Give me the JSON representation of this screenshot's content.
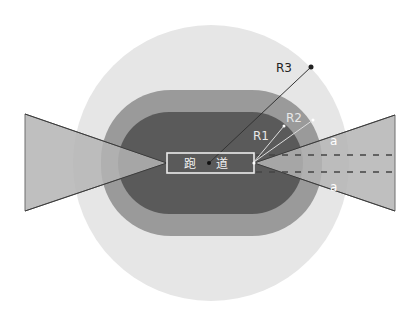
{
  "diagram": {
    "colors": {
      "background": "#ffffff",
      "outer_circle": "#e6e6e6",
      "middle_zone": "#9a9a9a",
      "inner_zone": "#5a5a5a",
      "triangle_fill": "#b4b4b4",
      "triangle_stroke": "#6e6e6e",
      "runway_stroke": "#ececec",
      "radius_r3": "#333333",
      "radius_r1_r2": "#dddddd",
      "dash": "#444444"
    },
    "runway": {
      "label_char1": "跑",
      "label_char2": "道"
    },
    "radii": {
      "r1": "R1",
      "r2": "R2",
      "r3": "R3"
    },
    "angles": {
      "upper": "a",
      "lower": "a"
    }
  }
}
